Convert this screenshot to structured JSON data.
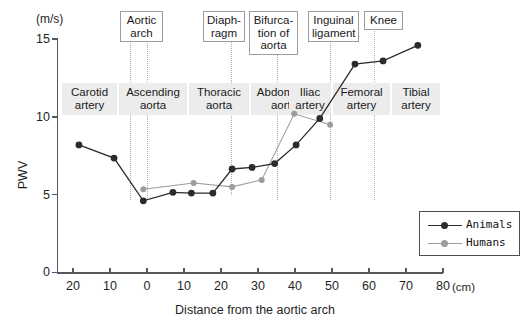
{
  "chart_data": {
    "type": "line",
    "title": "",
    "xlabel": "Distance from the aortic arch",
    "ylabel": "PWV",
    "x_unit": "(cm)",
    "y_unit": "(m/s)",
    "xlim": [
      -25,
      80
    ],
    "ylim": [
      0,
      15
    ],
    "xticks": [
      -20,
      -10,
      0,
      10,
      20,
      30,
      40,
      50,
      60,
      70,
      80
    ],
    "xtick_labels": [
      "20",
      "10",
      "0",
      "10",
      "20",
      "30",
      "40",
      "50",
      "60",
      "70",
      "80"
    ],
    "yticks": [
      0,
      5,
      10,
      15
    ],
    "ytick_labels": [
      "0",
      "5",
      "10",
      "15"
    ],
    "grid": false,
    "legend_position": "right-inside",
    "series": [
      {
        "name": "Animals",
        "color": "#2b2b2b",
        "points": [
          {
            "x": -18.4,
            "y": 8.2
          },
          {
            "x": -8.9,
            "y": 7.35
          },
          {
            "x": -1.0,
            "y": 4.6
          },
          {
            "x": 7.0,
            "y": 5.15
          },
          {
            "x": 12.0,
            "y": 5.1
          },
          {
            "x": 17.8,
            "y": 5.1
          },
          {
            "x": 23.0,
            "y": 6.65
          },
          {
            "x": 28.4,
            "y": 6.75
          },
          {
            "x": 34.5,
            "y": 7.0
          },
          {
            "x": 40.3,
            "y": 8.2
          },
          {
            "x": 46.7,
            "y": 9.9
          },
          {
            "x": 56.2,
            "y": 13.4
          },
          {
            "x": 63.8,
            "y": 13.6
          },
          {
            "x": 73.2,
            "y": 14.6
          }
        ]
      },
      {
        "name": "Humans",
        "color": "#9d9d9d",
        "points": [
          {
            "x": -1.0,
            "y": 5.35
          },
          {
            "x": 12.6,
            "y": 5.75
          },
          {
            "x": 23.0,
            "y": 5.5
          },
          {
            "x": 31.0,
            "y": 5.95
          },
          {
            "x": 39.8,
            "y": 10.2
          },
          {
            "x": 49.5,
            "y": 9.5
          }
        ]
      }
    ],
    "landmarks": [
      {
        "label": "Aortic\narch",
        "box_x": 120,
        "box_y": 11,
        "box_w": 43,
        "box_h": 30,
        "lines_x": [
          130,
          147
        ],
        "line_top": 41,
        "line_bottom": 200
      },
      {
        "label": "Diaph-\nragm",
        "box_x": 203,
        "box_y": 11,
        "box_w": 42,
        "box_h": 30,
        "lines_x": [
          231
        ],
        "line_top": 41,
        "line_bottom": 195
      },
      {
        "label": "Bifurca-\ntion of\naorta",
        "box_x": 249,
        "box_y": 11,
        "box_w": 49,
        "box_h": 43,
        "lines_x": [
          277
        ],
        "line_top": 54,
        "line_bottom": 200
      },
      {
        "label": "Inguinal\nligament",
        "box_x": 308,
        "box_y": 11,
        "box_w": 51,
        "box_h": 30,
        "lines_x": [
          330
        ],
        "line_top": 41,
        "line_bottom": 200
      },
      {
        "label": "Knee",
        "box_x": 364,
        "box_y": 11,
        "box_w": 39,
        "box_h": 17,
        "lines_x": [
          374
        ],
        "line_top": 28,
        "line_bottom": 200
      }
    ],
    "segments": [
      {
        "label": "Carotid\nartery",
        "x": 62,
        "y": 83,
        "w": 55,
        "h": 32
      },
      {
        "label": "Ascending\naorta",
        "x": 119,
        "y": 83,
        "w": 68,
        "h": 32
      },
      {
        "label": "Thoracic\naorta",
        "x": 189,
        "y": 83,
        "w": 60,
        "h": 32
      },
      {
        "label": "Abdominal\naorta",
        "x": 251,
        "y": 83,
        "w": 66,
        "h": 32
      },
      {
        "label": "Iliac\nartery",
        "x": 289,
        "y": 83,
        "w": 42,
        "h": 32
      },
      {
        "label": "Femoral\nartery",
        "x": 333,
        "y": 83,
        "w": 57,
        "h": 32
      },
      {
        "label": "Tibial\nartery",
        "x": 392,
        "y": 83,
        "w": 48,
        "h": 32
      }
    ]
  },
  "legend": {
    "items": [
      {
        "label": "Animals",
        "color": "#2b2b2b"
      },
      {
        "label": "Humans",
        "color": "#9d9d9d"
      }
    ]
  }
}
